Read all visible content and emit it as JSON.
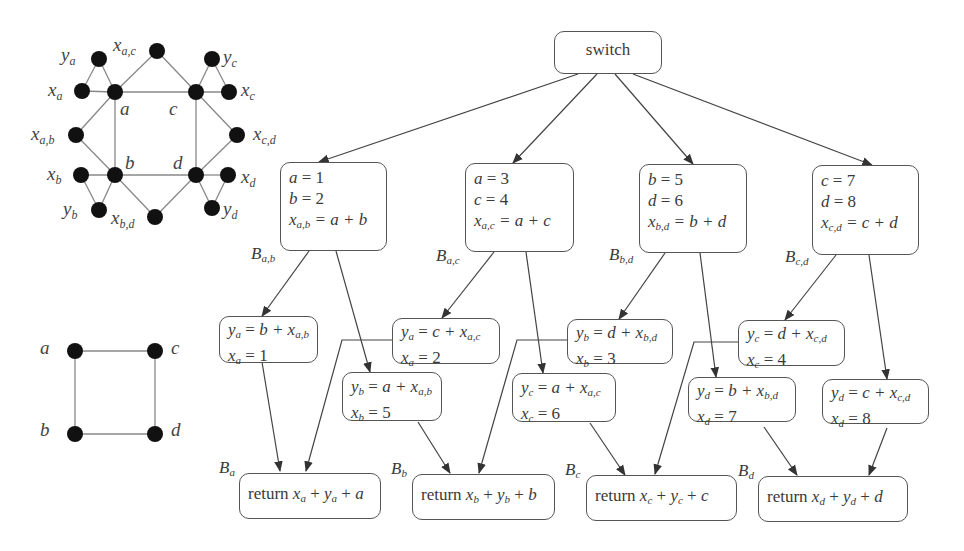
{
  "colors": {
    "node": "#111111",
    "edge": "#777777",
    "arrow": "#333333",
    "box_border": "#555555",
    "text": "#3a3a3a"
  },
  "top_graph": {
    "name": "extended interference graph",
    "vertices": [
      {
        "id": "a",
        "label": "a"
      },
      {
        "id": "b",
        "label": "b"
      },
      {
        "id": "c",
        "label": "c"
      },
      {
        "id": "d",
        "label": "d"
      },
      {
        "id": "xa",
        "label": "x",
        "sub": "a"
      },
      {
        "id": "ya",
        "label": "y",
        "sub": "a"
      },
      {
        "id": "xb",
        "label": "x",
        "sub": "b"
      },
      {
        "id": "yb",
        "label": "y",
        "sub": "b"
      },
      {
        "id": "xc",
        "label": "x",
        "sub": "c"
      },
      {
        "id": "yc",
        "label": "y",
        "sub": "c"
      },
      {
        "id": "xd",
        "label": "x",
        "sub": "d"
      },
      {
        "id": "yd",
        "label": "y",
        "sub": "d"
      },
      {
        "id": "xac",
        "label": "x",
        "sub": "a,c"
      },
      {
        "id": "xab",
        "label": "x",
        "sub": "a,b"
      },
      {
        "id": "xcd",
        "label": "x",
        "sub": "c,d"
      },
      {
        "id": "xbd",
        "label": "x",
        "sub": "b,d"
      }
    ]
  },
  "bottom_graph": {
    "name": "square interference graph",
    "vertices": [
      {
        "label": "a"
      },
      {
        "label": "b"
      },
      {
        "label": "c"
      },
      {
        "label": "d"
      }
    ]
  },
  "cfg": {
    "switch": {
      "label": "switch"
    },
    "blocks": [
      {
        "label": "B",
        "sub": "a,b",
        "lines": [
          {
            "lhs": "a",
            "rhs": " = 1"
          },
          {
            "lhs": "b",
            "rhs": " = 2"
          },
          {
            "lhs": "x",
            "lsub": "a,b",
            "rhs": " = a + b"
          }
        ]
      },
      {
        "label": "B",
        "sub": "a,c",
        "lines": [
          {
            "lhs": "a",
            "rhs": " = 3"
          },
          {
            "lhs": "c",
            "rhs": " = 4"
          },
          {
            "lhs": "x",
            "lsub": "a,c",
            "rhs": " = a + c"
          }
        ]
      },
      {
        "label": "B",
        "sub": "b,d",
        "lines": [
          {
            "lhs": "b",
            "rhs": " = 5"
          },
          {
            "lhs": "d",
            "rhs": " = 6"
          },
          {
            "lhs": "x",
            "lsub": "b,d",
            "rhs": " = b + d"
          }
        ]
      },
      {
        "label": "B",
        "sub": "c,d",
        "lines": [
          {
            "lhs": "c",
            "rhs": " = 7"
          },
          {
            "lhs": "d",
            "rhs": " = 8"
          },
          {
            "lhs": "x",
            "lsub": "c,d",
            "rhs": " = c + d"
          }
        ]
      }
    ],
    "copies": [
      {
        "y": "y",
        "ysub": "a",
        "expr": "b + x",
        "esub": "a,b",
        "x": "x",
        "xsub": "a",
        "val": "1"
      },
      {
        "y": "y",
        "ysub": "b",
        "expr": "a + x",
        "esub": "a,b",
        "x": "x",
        "xsub": "b",
        "val": "5"
      },
      {
        "y": "y",
        "ysub": "a",
        "expr": "c + x",
        "esub": "a,c",
        "x": "x",
        "xsub": "a",
        "val": "2"
      },
      {
        "y": "y",
        "ysub": "c",
        "expr": "a + x",
        "esub": "a,c",
        "x": "x",
        "xsub": "c",
        "val": "6"
      },
      {
        "y": "y",
        "ysub": "b",
        "expr": "d + x",
        "esub": "b,d",
        "x": "x",
        "xsub": "b",
        "val": "3"
      },
      {
        "y": "y",
        "ysub": "d",
        "expr": "b + x",
        "esub": "b,d",
        "x": "x",
        "xsub": "d",
        "val": "7"
      },
      {
        "y": "y",
        "ysub": "c",
        "expr": "d + x",
        "esub": "c,d",
        "x": "x",
        "xsub": "c",
        "val": "4"
      },
      {
        "y": "y",
        "ysub": "d",
        "expr": "c + x",
        "esub": "c,d",
        "x": "x",
        "xsub": "d",
        "val": "8"
      }
    ],
    "returns": [
      {
        "label": "B",
        "sub": "a",
        "kw": "return ",
        "t1": "x",
        "s1": "a",
        "t2": "y",
        "s2": "a",
        "t3": "a"
      },
      {
        "label": "B",
        "sub": "b",
        "kw": "return ",
        "t1": "x",
        "s1": "b",
        "t2": "y",
        "s2": "b",
        "t3": "b"
      },
      {
        "label": "B",
        "sub": "c",
        "kw": "return ",
        "t1": "x",
        "s1": "c",
        "t2": "y",
        "s2": "c",
        "t3": "c"
      },
      {
        "label": "B",
        "sub": "d",
        "kw": "return ",
        "t1": "x",
        "s1": "d",
        "t2": "y",
        "s2": "d",
        "t3": "d"
      }
    ],
    "plus": " + ",
    "eq": " = "
  }
}
